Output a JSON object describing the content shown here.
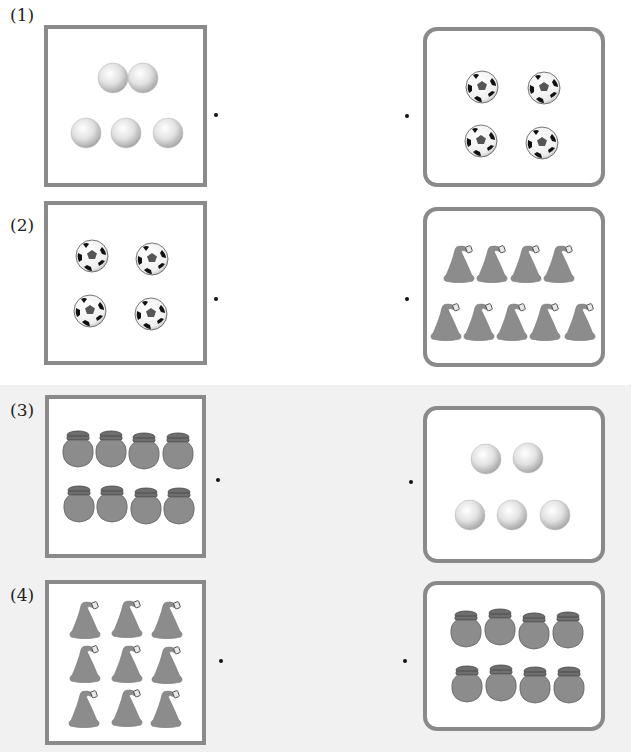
{
  "worksheet": {
    "questions": [
      {
        "label": "(1)",
        "left_item": "pearl",
        "left_count": 5,
        "right_item": "soccer-ball",
        "right_count": 4
      },
      {
        "label": "(2)",
        "left_item": "soccer-ball",
        "left_count": 4,
        "right_item": "hat",
        "right_count": 9
      },
      {
        "label": "(3)",
        "left_item": "jar",
        "left_count": 8,
        "right_item": "pearl",
        "right_count": 5
      },
      {
        "label": "(4)",
        "left_item": "hat",
        "left_count": 9,
        "right_item": "jar",
        "right_count": 8
      }
    ],
    "colors": {
      "border": "#8a8a8a",
      "band": "#f1f1f1",
      "object_fill": "#8c8c8c"
    }
  }
}
